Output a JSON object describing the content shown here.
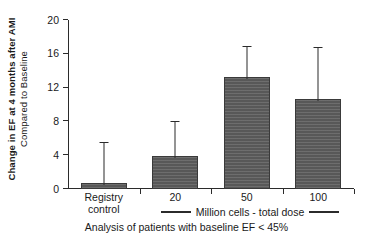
{
  "chart_data": {
    "type": "bar",
    "title": "",
    "subtitle": "",
    "categories": [
      "Registry control",
      "20",
      "50",
      "100"
    ],
    "category_lines": [
      [
        "Registry",
        "control"
      ],
      [
        "20"
      ],
      [
        "50"
      ],
      [
        "100"
      ]
    ],
    "values": [
      0.7,
      3.9,
      13.2,
      10.6
    ],
    "errors_upper": [
      4.7,
      4.0,
      3.6,
      6.1
    ],
    "error_tops": [
      5.4,
      7.9,
      16.8,
      16.7
    ],
    "series": [
      {
        "name": "Change in EF",
        "values": [
          0.7,
          3.9,
          13.2,
          10.6
        ]
      }
    ],
    "xlabel": "Million cells - total dose",
    "ylabel_line1": "Change in EF at 4 months after AMI",
    "ylabel_line2": "Compared to Baseline",
    "ylim": [
      0,
      20
    ],
    "yticks": [
      0,
      4,
      8,
      12,
      16,
      20
    ],
    "ytick_labels": [
      "0",
      "4",
      "8",
      "12",
      "16",
      "20"
    ],
    "grid": false,
    "legend": false,
    "caption": "Analysis of patients with baseline EF < 45%",
    "bar_color": "#5d5d5d",
    "bar_edge_color": "#3a3a3a",
    "axis_color": "#2b2b2b",
    "error_bar_color": "#2b2b2b"
  },
  "axis": {
    "ytick_labels": [
      "0",
      "4",
      "8",
      "12",
      "16",
      "20"
    ]
  },
  "xaxis_legend": {
    "label": "Million cells - total dose"
  },
  "footer": {
    "caption": "Analysis of patients with baseline EF < 45%"
  }
}
